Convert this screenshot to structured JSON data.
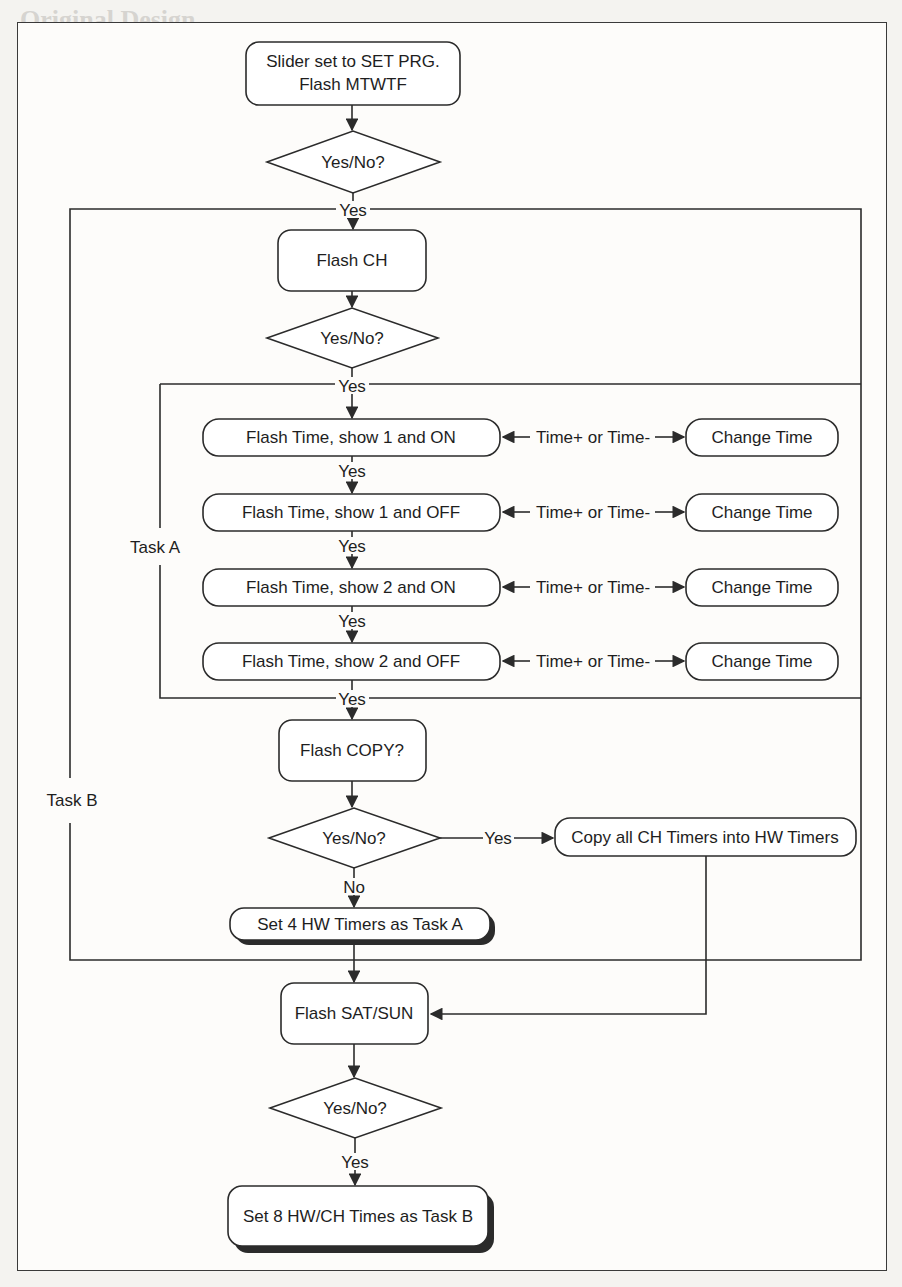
{
  "background_text": {
    "heading": "Original Design"
  },
  "flowchart": {
    "start_box": {
      "line1": "Slider set to SET PRG.",
      "line2": "Flash MTWTF"
    },
    "decisions": [
      {
        "label": "Yes/No?"
      },
      {
        "label": "Yes/No?"
      },
      {
        "label": "Yes/No?"
      },
      {
        "label": "Yes/No?"
      }
    ],
    "flash_ch": "Flash CH",
    "task_a_rows": [
      {
        "action": "Flash Time, show 1 and ON",
        "edge": "Time+ or Time-",
        "result": "Change Time"
      },
      {
        "action": "Flash Time, show 1 and OFF",
        "edge": "Time+ or Time-",
        "result": "Change Time"
      },
      {
        "action": "Flash Time, show 2 and ON",
        "edge": "Time+ or Time-",
        "result": "Change Time"
      },
      {
        "action": "Flash Time, show 2 and OFF",
        "edge": "Time+ or Time-",
        "result": "Change Time"
      }
    ],
    "flash_copy": "Flash COPY?",
    "copy_box": "Copy all CH Timers into HW Timers",
    "set_task_a": "Set 4 HW Timers as Task A",
    "flash_satsun": "Flash SAT/SUN",
    "set_task_b": "Set 8 HW/CH Times as Task B",
    "edge_labels": {
      "yes": "Yes",
      "no": "No"
    },
    "loop_labels": {
      "task_a": "Task A",
      "task_b": "Task B"
    },
    "colors": {
      "line": "#2b2b2b",
      "box_fill": "#ffffff",
      "page": "#fdfcfa"
    }
  }
}
